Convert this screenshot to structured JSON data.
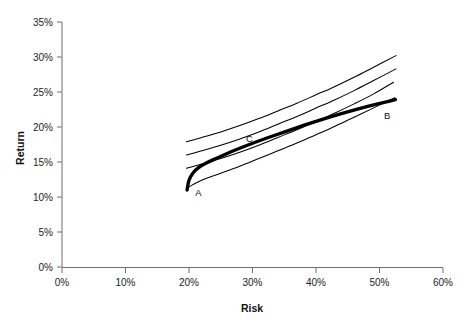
{
  "chart_data": {
    "type": "line",
    "title": "",
    "xlabel": "Risk",
    "ylabel": "Return",
    "xlim": [
      0,
      60
    ],
    "ylim": [
      0,
      35
    ],
    "x_ticks": [
      "0%",
      "10%",
      "20%",
      "30%",
      "40%",
      "50%",
      "60%"
    ],
    "x_tick_values": [
      0,
      10,
      20,
      30,
      40,
      50,
      60
    ],
    "y_ticks": [
      "0%",
      "5%",
      "10%",
      "15%",
      "20%",
      "25%",
      "30%",
      "35%"
    ],
    "y_tick_values": [
      0,
      5,
      10,
      15,
      20,
      25,
      30,
      35
    ],
    "grid": false,
    "legend": "none",
    "series": [
      {
        "name": "efficient-frontier",
        "style": "thick",
        "points": [
          [
            19.7,
            11.0
          ],
          [
            20.0,
            12.4
          ],
          [
            20.6,
            13.4
          ],
          [
            21.5,
            14.2
          ],
          [
            22.8,
            14.9
          ],
          [
            24.5,
            15.6
          ],
          [
            27.0,
            16.6
          ],
          [
            29.5,
            17.5
          ],
          [
            32.5,
            18.5
          ],
          [
            36.0,
            19.6
          ],
          [
            40.0,
            20.8
          ],
          [
            44.0,
            21.9
          ],
          [
            48.0,
            22.9
          ],
          [
            52.5,
            23.9
          ]
        ]
      },
      {
        "name": "indifference-curve-1",
        "style": "thin",
        "points": [
          [
            19.6,
            17.9
          ],
          [
            22.0,
            18.5
          ],
          [
            25.0,
            19.3
          ],
          [
            28.0,
            20.2
          ],
          [
            31.0,
            21.2
          ],
          [
            34.0,
            22.3
          ],
          [
            37.0,
            23.4
          ],
          [
            40.0,
            24.6
          ],
          [
            43.0,
            25.8
          ],
          [
            46.0,
            27.1
          ],
          [
            49.0,
            28.5
          ],
          [
            52.6,
            30.2
          ]
        ]
      },
      {
        "name": "indifference-curve-2",
        "style": "thin",
        "points": [
          [
            19.6,
            16.0
          ],
          [
            22.0,
            16.6
          ],
          [
            25.0,
            17.4
          ],
          [
            28.0,
            18.3
          ],
          [
            31.0,
            19.3
          ],
          [
            34.0,
            20.4
          ],
          [
            37.0,
            21.5
          ],
          [
            40.0,
            22.7
          ],
          [
            43.0,
            23.9
          ],
          [
            46.0,
            25.2
          ],
          [
            49.0,
            26.6
          ],
          [
            52.6,
            28.3
          ]
        ]
      },
      {
        "name": "indifference-curve-3",
        "style": "thin",
        "points": [
          [
            19.6,
            14.1
          ],
          [
            22.0,
            14.7
          ],
          [
            25.0,
            15.5
          ],
          [
            28.0,
            16.4
          ],
          [
            31.0,
            17.4
          ],
          [
            34.0,
            18.5
          ],
          [
            37.0,
            19.6
          ],
          [
            40.0,
            20.8
          ],
          [
            43.0,
            22.0
          ],
          [
            46.0,
            23.3
          ],
          [
            49.0,
            24.7
          ],
          [
            52.2,
            26.4
          ]
        ]
      },
      {
        "name": "indifference-curve-4",
        "style": "thin",
        "points": [
          [
            19.9,
            11.4
          ],
          [
            22.0,
            12.4
          ],
          [
            25.0,
            13.4
          ],
          [
            28.0,
            14.4
          ],
          [
            31.0,
            15.5
          ],
          [
            34.0,
            16.6
          ],
          [
            37.0,
            17.7
          ],
          [
            40.0,
            18.9
          ],
          [
            43.0,
            20.1
          ],
          [
            46.0,
            21.4
          ],
          [
            49.0,
            22.7
          ],
          [
            52.4,
            24.2
          ]
        ]
      }
    ],
    "annotations": [
      {
        "text": "A",
        "x": 21.5,
        "y": 10.2
      },
      {
        "text": "B",
        "x": 51.2,
        "y": 21.2
      },
      {
        "text": "C",
        "x": 29.5,
        "y": 17.9
      }
    ]
  },
  "axes": {
    "x_title": "Risk",
    "y_title": "Return"
  }
}
